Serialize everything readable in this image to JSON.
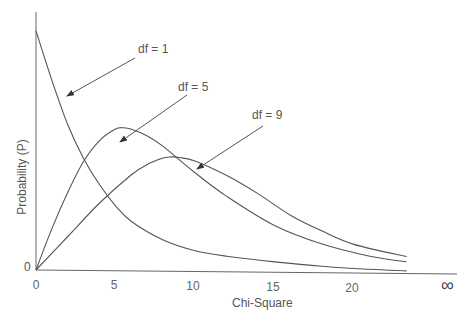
{
  "chart_data": {
    "type": "line",
    "title": "",
    "xlabel": "Chi-Square",
    "ylabel": "Probability (P)",
    "x_ticks": [
      "0",
      "5",
      "10",
      "15",
      "20"
    ],
    "x_infinity_label": "∞",
    "y_ticks": [
      "0"
    ],
    "xlim": [
      0,
      23.3
    ],
    "grid": false,
    "legend": "annotations with arrows",
    "series": [
      {
        "name": "df = 1",
        "x": [
          0,
          1,
          2,
          3,
          4,
          5,
          6,
          8,
          10,
          12,
          15,
          18,
          21,
          23.3
        ],
        "values": [
          0.92,
          0.73,
          0.56,
          0.43,
          0.33,
          0.25,
          0.19,
          0.12,
          0.08,
          0.06,
          0.04,
          0.025,
          0.015,
          0.01
        ]
      },
      {
        "name": "df = 5",
        "x": [
          0,
          1,
          2,
          3,
          4,
          5,
          5.5,
          6,
          7,
          8,
          10,
          12,
          15,
          18,
          21,
          23.3
        ],
        "values": [
          0,
          0.16,
          0.3,
          0.42,
          0.5,
          0.545,
          0.55,
          0.545,
          0.52,
          0.48,
          0.38,
          0.29,
          0.18,
          0.11,
          0.065,
          0.045
        ]
      },
      {
        "name": "df = 9",
        "x": [
          0,
          2,
          4,
          6,
          7,
          8,
          8.5,
          9,
          10,
          12,
          14,
          16,
          18,
          20,
          23.3
        ],
        "values": [
          0,
          0.13,
          0.26,
          0.37,
          0.41,
          0.435,
          0.44,
          0.438,
          0.425,
          0.37,
          0.3,
          0.22,
          0.16,
          0.11,
          0.065
        ]
      }
    ],
    "annotations": [
      {
        "text": "df = 1",
        "points_to_series": "df = 1"
      },
      {
        "text": "df = 5",
        "points_to_series": "df = 5"
      },
      {
        "text": "df = 9",
        "points_to_series": "df = 9"
      }
    ]
  },
  "labels": {
    "xlabel": "Chi-Square",
    "ylabel": "Probability (P)",
    "y_zero": "0",
    "x0": "0",
    "x5": "5",
    "x10": "10",
    "x15": "15",
    "x20": "20",
    "xinf": "∞",
    "df1": "df = 1",
    "df5": "df = 5",
    "df9": "df = 9"
  },
  "colors": {
    "line": "#555555",
    "axis": "#666666",
    "text": "#555555"
  }
}
